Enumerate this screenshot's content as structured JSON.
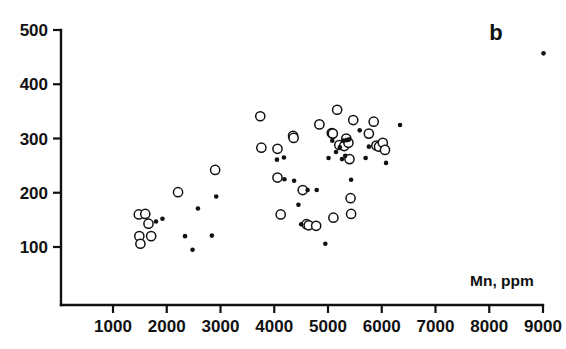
{
  "chart_data": {
    "type": "scatter",
    "title": "",
    "panel_label": "b",
    "xlabel": "Mn, ppm",
    "ylabel": "",
    "xlim": [
      0,
      9400
    ],
    "ylim": [
      40,
      510
    ],
    "grid": false,
    "legend": "none",
    "xticks": [
      1000,
      2000,
      3000,
      4000,
      5000,
      6000,
      7000,
      8000,
      9000
    ],
    "xticklabels": [
      "1000",
      "2000",
      "3000",
      "4000",
      "5000",
      "6000",
      "7000",
      "8000",
      "9000"
    ],
    "yticks": [
      100,
      200,
      300,
      400,
      500
    ],
    "yticklabels": [
      "100",
      "200",
      "300",
      "400",
      "500"
    ],
    "series": [
      {
        "name": "open-circles",
        "marker": "open-circle",
        "color": "#111111",
        "points": [
          [
            1480,
            160
          ],
          [
            1600,
            161
          ],
          [
            1660,
            143
          ],
          [
            1490,
            120
          ],
          [
            1510,
            106
          ],
          [
            1710,
            120
          ],
          [
            2210,
            201
          ],
          [
            2900,
            242
          ],
          [
            3740,
            341
          ],
          [
            3760,
            283
          ],
          [
            4060,
            281
          ],
          [
            4060,
            228
          ],
          [
            4120,
            160
          ],
          [
            4350,
            305
          ],
          [
            4360,
            301
          ],
          [
            4530,
            205
          ],
          [
            4600,
            142
          ],
          [
            4640,
            140
          ],
          [
            4780,
            139
          ],
          [
            4840,
            326
          ],
          [
            5070,
            310
          ],
          [
            5090,
            309
          ],
          [
            5100,
            154
          ],
          [
            5170,
            353
          ],
          [
            5210,
            288
          ],
          [
            5300,
            286
          ],
          [
            5340,
            300
          ],
          [
            5380,
            292
          ],
          [
            5400,
            262
          ],
          [
            5420,
            190
          ],
          [
            5430,
            161
          ],
          [
            5470,
            334
          ],
          [
            5760,
            309
          ],
          [
            5850,
            331
          ],
          [
            5900,
            287
          ],
          [
            5950,
            285
          ],
          [
            6020,
            292
          ],
          [
            6060,
            279
          ]
        ]
      },
      {
        "name": "filled-dots",
        "marker": "filled-circle",
        "color": "#111111",
        "points": [
          [
            1800,
            147
          ],
          [
            1920,
            152
          ],
          [
            2340,
            120
          ],
          [
            2480,
            95
          ],
          [
            2580,
            171
          ],
          [
            2840,
            121
          ],
          [
            2920,
            193
          ],
          [
            4050,
            261
          ],
          [
            4180,
            265
          ],
          [
            4190,
            225
          ],
          [
            4370,
            222
          ],
          [
            4450,
            178
          ],
          [
            4500,
            142
          ],
          [
            4620,
            205
          ],
          [
            4790,
            205
          ],
          [
            4950,
            106
          ],
          [
            5010,
            264
          ],
          [
            5080,
            296
          ],
          [
            5150,
            275
          ],
          [
            5220,
            284
          ],
          [
            5260,
            262
          ],
          [
            5290,
            296
          ],
          [
            5320,
            268
          ],
          [
            5350,
            297
          ],
          [
            5390,
            298
          ],
          [
            5430,
            224
          ],
          [
            5590,
            315
          ],
          [
            5700,
            264
          ],
          [
            5760,
            285
          ],
          [
            6080,
            255
          ],
          [
            6340,
            325
          ],
          [
            9010,
            457
          ]
        ]
      }
    ]
  }
}
